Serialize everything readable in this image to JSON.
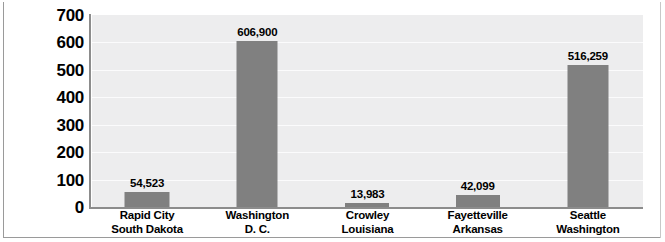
{
  "chart_data": {
    "type": "bar",
    "title": "",
    "xlabel": "",
    "ylabel": "Population (In Thousands)",
    "ylim": [
      0,
      700
    ],
    "ytick_step": 100,
    "ytick_labels": [
      "700",
      "600",
      "500",
      "400",
      "300",
      "200",
      "100",
      "0"
    ],
    "grid": true,
    "legend": "none",
    "units_note": "Axis is in thousands; data labels show full population counts",
    "bar_color": "#808080",
    "plot_bg": "#ededee",
    "gridline_color": "#fbfbfc",
    "axis_color": "#8c8c8c",
    "categories": [
      "Rapid City South Dakota",
      "Washington D. C.",
      "Crowley Louisiana",
      "Fayetteville Arkansas",
      "Seattle Washington"
    ],
    "category_lines": [
      {
        "line1": "Rapid City",
        "line2": "South Dakota"
      },
      {
        "line1": "Washington",
        "line2": "D. C."
      },
      {
        "line1": "Crowley",
        "line2": "Louisiana"
      },
      {
        "line1": "Fayetteville",
        "line2": "Arkansas"
      },
      {
        "line1": "Seattle",
        "line2": "Washington"
      }
    ],
    "values": [
      54523,
      606900,
      13983,
      42099,
      516259
    ],
    "values_thousands": [
      54.523,
      606.9,
      13.983,
      42.099,
      516.259
    ],
    "data_labels": [
      "54,523",
      "606,900",
      "13,983",
      "42,099",
      "516,259"
    ]
  }
}
